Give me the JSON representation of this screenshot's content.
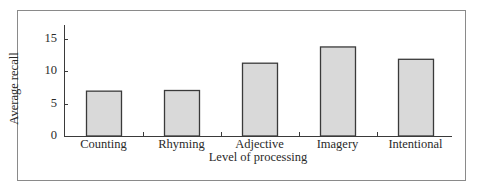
{
  "chart_data": {
    "type": "bar",
    "title": "",
    "xlabel": "Level of processing",
    "ylabel": "Average recall",
    "categories": [
      "Counting",
      "Rhyming",
      "Adjective",
      "Imagery",
      "Intentional"
    ],
    "values": [
      6.9,
      7.0,
      11.2,
      13.7,
      11.8
    ],
    "ylim": [
      0,
      17
    ],
    "yticks": [
      0,
      5,
      10,
      15
    ],
    "grid": false,
    "legend": null,
    "bar_color": "#d9d9d9",
    "bar_edge_color": "#3a3a3a"
  },
  "axis": {
    "xlabel": "Level of processing",
    "ylabel": "Average recall",
    "ytick_labels": [
      "0",
      "5",
      "10",
      "15"
    ]
  }
}
